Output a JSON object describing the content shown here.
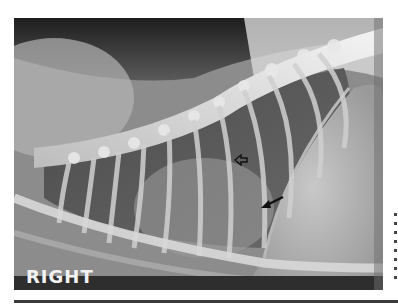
{
  "image": {
    "type": "lateral thoracic radiograph",
    "marker_label": "RIGHT",
    "annotations": [
      {
        "name": "open-arrow",
        "style": "outlined",
        "direction": "left",
        "x": 235,
        "y": 160
      },
      {
        "name": "solid-arrow",
        "style": "filled",
        "direction": "down-left",
        "x": 262,
        "y": 207
      }
    ]
  },
  "colors": {
    "background": "#ffffff",
    "soft_tissue": "#8a8a8a",
    "air_dark": "#2a2a2a",
    "bone": "#e6e6e6",
    "marker_text": "#f2f2f2"
  }
}
